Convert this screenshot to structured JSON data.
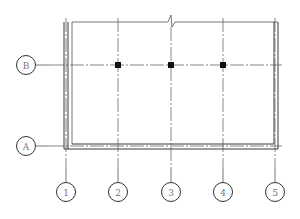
{
  "drawing": {
    "type": "structural-grid-plan",
    "colors": {
      "line": "#3a3a3a",
      "grid_line": "#555555",
      "bubble_stroke": "#333333",
      "bubble_text": "#777777",
      "column_fill": "#111111"
    },
    "grid_rows": [
      {
        "label": "B",
        "y": 65
      },
      {
        "label": "A",
        "y": 146
      }
    ],
    "grid_columns": [
      {
        "label": "1",
        "x": 66
      },
      {
        "label": "2",
        "x": 118
      },
      {
        "label": "3",
        "x": 171
      },
      {
        "label": "4",
        "x": 223
      },
      {
        "label": "5",
        "x": 275
      }
    ],
    "columns": [
      {
        "grid": "B-2",
        "x": 118,
        "y": 65
      },
      {
        "grid": "B-3",
        "x": 171,
        "y": 65
      },
      {
        "grid": "B-4",
        "x": 223,
        "y": 65
      }
    ],
    "break_symbol": {
      "x": 172,
      "y": 22
    }
  }
}
